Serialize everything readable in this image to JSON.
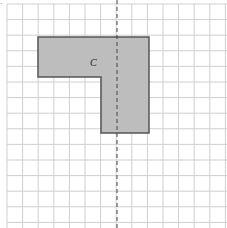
{
  "diagram": {
    "grid": {
      "x0": 7,
      "y0": 4,
      "cell": 15.6,
      "cols": 14,
      "rows": 14,
      "color": "#cfcfcf"
    },
    "shape": {
      "label": "C",
      "fill": "#bdbdbd",
      "stroke": "#555555",
      "points": "38,37 149,37 149,133 101,133 101,77 38,77"
    },
    "mirror_line": {
      "x": 117,
      "color": "#444444"
    },
    "corner_mark": "·"
  }
}
